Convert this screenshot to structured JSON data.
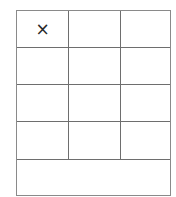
{
  "board": {
    "rows": [
      [
        "×",
        "",
        ""
      ],
      [
        "",
        "",
        ""
      ],
      [
        "",
        "",
        ""
      ],
      [
        "",
        "",
        ""
      ]
    ],
    "footer": ""
  }
}
